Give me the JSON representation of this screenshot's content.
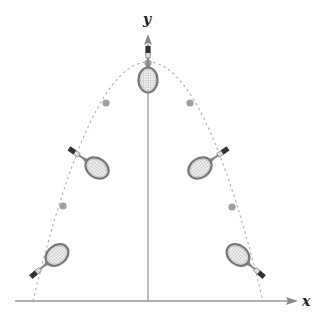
{
  "diagram": {
    "axes": {
      "x_label": "x",
      "y_label": "y",
      "origin": [
        148,
        301
      ],
      "x_axis": {
        "from": 15,
        "to": 300
      },
      "y_axis": {
        "from": 301,
        "to": 35
      }
    },
    "trajectory": {
      "type": "parabola",
      "style": "dashed",
      "apex": [
        148,
        62
      ],
      "left_base": [
        33,
        301
      ],
      "right_base": [
        263,
        301
      ]
    },
    "points": [
      {
        "x": 148,
        "y": 63
      },
      {
        "x": 106,
        "y": 103
      },
      {
        "x": 190,
        "y": 103
      },
      {
        "x": 63,
        "y": 206
      },
      {
        "x": 232,
        "y": 207
      }
    ],
    "rackets": [
      {
        "head_center": [
          148,
          79
        ],
        "handle_angle": -90
      },
      {
        "head_center": [
          97,
          168
        ],
        "handle_angle": -145
      },
      {
        "head_center": [
          200,
          168
        ],
        "handle_angle": -35
      },
      {
        "head_center": [
          57,
          255
        ],
        "handle_angle": 140
      },
      {
        "head_center": [
          238,
          255
        ],
        "handle_angle": 40
      }
    ],
    "colors": {
      "axis": "#999999",
      "curve": "#aaaaaa",
      "point": "#999999",
      "racket_frame": "#777777",
      "racket_strings": "#bbbbbb",
      "grip": "#333333"
    }
  }
}
